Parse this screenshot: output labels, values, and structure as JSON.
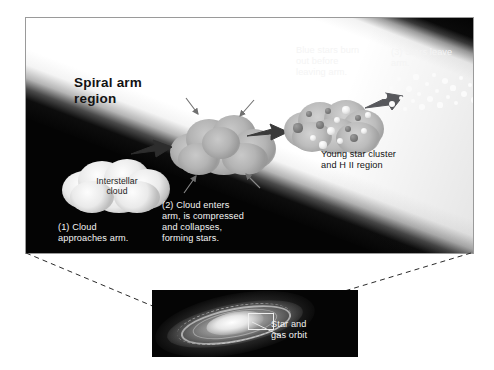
{
  "figure": {
    "kind": "astronomy-diagram"
  },
  "main_panel": {
    "title": "Spiral arm\nregion",
    "labels": {
      "interstellar_cloud": "Interstellar\ncloud",
      "step1": "(1) Cloud\napproaches arm.",
      "step2": "(2) Cloud enters\narm, is compressed\nand collapses,\nforming stars.",
      "blue_stars": "Blue stars burn\nout before\nleaving arm.",
      "step3": "(3) Stars leave arm.",
      "young_cluster": "Young star cluster\nand H II region"
    },
    "colors": {
      "background": "#040404",
      "arm_band": "#ffffff",
      "light_text": "#f4f4f4",
      "dark_text": "#121212"
    }
  },
  "inset_panel": {
    "label_star_gas_orbit": "Star and\ngas orbit",
    "background": "#050505"
  },
  "icons": {
    "motion_arrow": "thick-right-arrow",
    "compression_arrow": "thin-arrow"
  },
  "stage_sequence": [
    {
      "id": "stage-1",
      "name": "interstellar-cloud",
      "caption": "(1) Cloud\napproaches arm."
    },
    {
      "id": "stage-2",
      "name": "collapsing-cloud",
      "caption": "(2) Cloud enters\narm, is compressed\nand collapses,\nforming stars."
    },
    {
      "id": "stage-3",
      "name": "young-star-cluster",
      "caption": "Young star cluster\nand H II region"
    },
    {
      "id": "stage-4",
      "name": "dispersed-stars",
      "caption": "(3) Stars leave arm."
    }
  ],
  "cluster_stars": [
    {
      "x": 16,
      "y": 30,
      "r": 4.6,
      "kind": "dim"
    },
    {
      "x": 27,
      "y": 16,
      "r": 3.4,
      "kind": "dim"
    },
    {
      "x": 31,
      "y": 40,
      "r": 3.0,
      "kind": "bright"
    },
    {
      "x": 38,
      "y": 27,
      "r": 4.0,
      "kind": "dim"
    },
    {
      "x": 41,
      "y": 47,
      "r": 3.6,
      "kind": "bright"
    },
    {
      "x": 46,
      "y": 13,
      "r": 3.2,
      "kind": "dim"
    },
    {
      "x": 49,
      "y": 33,
      "r": 4.4,
      "kind": "bright"
    },
    {
      "x": 55,
      "y": 22,
      "r": 3.0,
      "kind": "bright"
    },
    {
      "x": 58,
      "y": 43,
      "r": 3.4,
      "kind": "bright"
    },
    {
      "x": 64,
      "y": 12,
      "r": 3.6,
      "kind": "bright"
    },
    {
      "x": 66,
      "y": 31,
      "r": 3.0,
      "kind": "dim"
    },
    {
      "x": 72,
      "y": 40,
      "r": 4.0,
      "kind": "dim"
    },
    {
      "x": 76,
      "y": 20,
      "r": 3.2,
      "kind": "dim"
    },
    {
      "x": 82,
      "y": 33,
      "r": 3.4,
      "kind": "bright"
    },
    {
      "x": 86,
      "y": 17,
      "r": 2.6,
      "kind": "bright"
    }
  ],
  "dispersed_stars": [
    {
      "x": 6,
      "y": 26,
      "r": 2.6
    },
    {
      "x": 13,
      "y": 18,
      "r": 2.0
    },
    {
      "x": 14,
      "y": 34,
      "r": 3.0
    },
    {
      "x": 21,
      "y": 9,
      "r": 2.4
    },
    {
      "x": 23,
      "y": 28,
      "r": 2.0
    },
    {
      "x": 27,
      "y": 39,
      "r": 2.2
    },
    {
      "x": 31,
      "y": 19,
      "r": 3.2
    },
    {
      "x": 35,
      "y": 31,
      "r": 2.0
    },
    {
      "x": 38,
      "y": 7,
      "r": 2.6
    },
    {
      "x": 41,
      "y": 24,
      "r": 2.2
    },
    {
      "x": 44,
      "y": 37,
      "r": 2.8
    },
    {
      "x": 49,
      "y": 14,
      "r": 2.0
    },
    {
      "x": 52,
      "y": 29,
      "r": 3.2
    },
    {
      "x": 56,
      "y": 5,
      "r": 2.4
    },
    {
      "x": 59,
      "y": 21,
      "r": 2.0
    },
    {
      "x": 62,
      "y": 35,
      "r": 2.6
    },
    {
      "x": 67,
      "y": 11,
      "r": 3.0
    },
    {
      "x": 70,
      "y": 27,
      "r": 2.2
    },
    {
      "x": 75,
      "y": 18,
      "r": 2.6
    },
    {
      "x": 78,
      "y": 33,
      "r": 2.0
    },
    {
      "x": 83,
      "y": 8,
      "r": 2.4
    },
    {
      "x": 86,
      "y": 24,
      "r": 3.0
    },
    {
      "x": 92,
      "y": 15,
      "r": 2.2
    },
    {
      "x": 96,
      "y": 30,
      "r": 2.6
    },
    {
      "x": 101,
      "y": 20,
      "r": 2.0
    },
    {
      "x": 106,
      "y": 10,
      "r": 2.4
    }
  ]
}
